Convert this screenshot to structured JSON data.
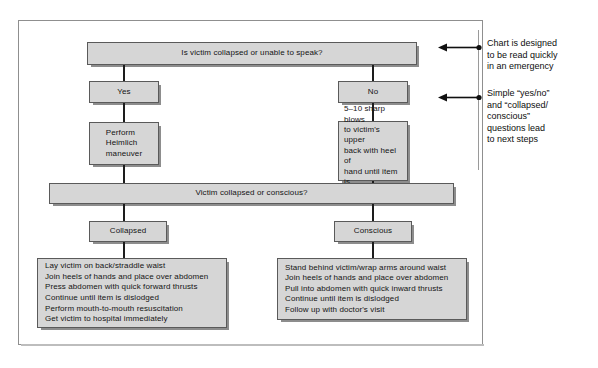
{
  "diagram": {
    "fill_color": "#d6d6d6",
    "border_color": "#5a5a5a",
    "shadow_color": "#8d8d8d",
    "line_color": "#1d1d1d"
  },
  "nodes": {
    "q1": "Is victim collapsed or unable to speak?",
    "yes": "Yes",
    "no": "No",
    "heimlich": "Perform\nHeimlich\nmaneuver",
    "back_blows": "5–10 sharp blows\nto victim's upper\nback with heel of\nhand until item is\ndislodged",
    "q2": "Victim collapsed or conscious?",
    "collapsed": "Collapsed",
    "conscious": "Conscious",
    "collapsed_steps": "Lay victim on back/straddle waist\nJoin heels of hands and place over abdomen\nPress abdomen with quick forward thrusts\nContinue until item is dislodged\nPerform mouth-to-mouth resuscitation\nGet victim to hospital immediately",
    "conscious_steps": "Stand behind victim/wrap arms around waist\nJoin heels of hands and place over abdomen\nPull into abdomen with quick inward thrusts\nContinue until item is dislodged\nFollow up with doctor's visit"
  },
  "annotations": [
    {
      "id": "annotation-1",
      "text": "Chart is designed\nto be read quickly\nin an emergency"
    },
    {
      "id": "annotation-2",
      "text": "Simple “yes/no”\nand “collapsed/\nconscious”\nquestions lead\nto next steps"
    }
  ]
}
